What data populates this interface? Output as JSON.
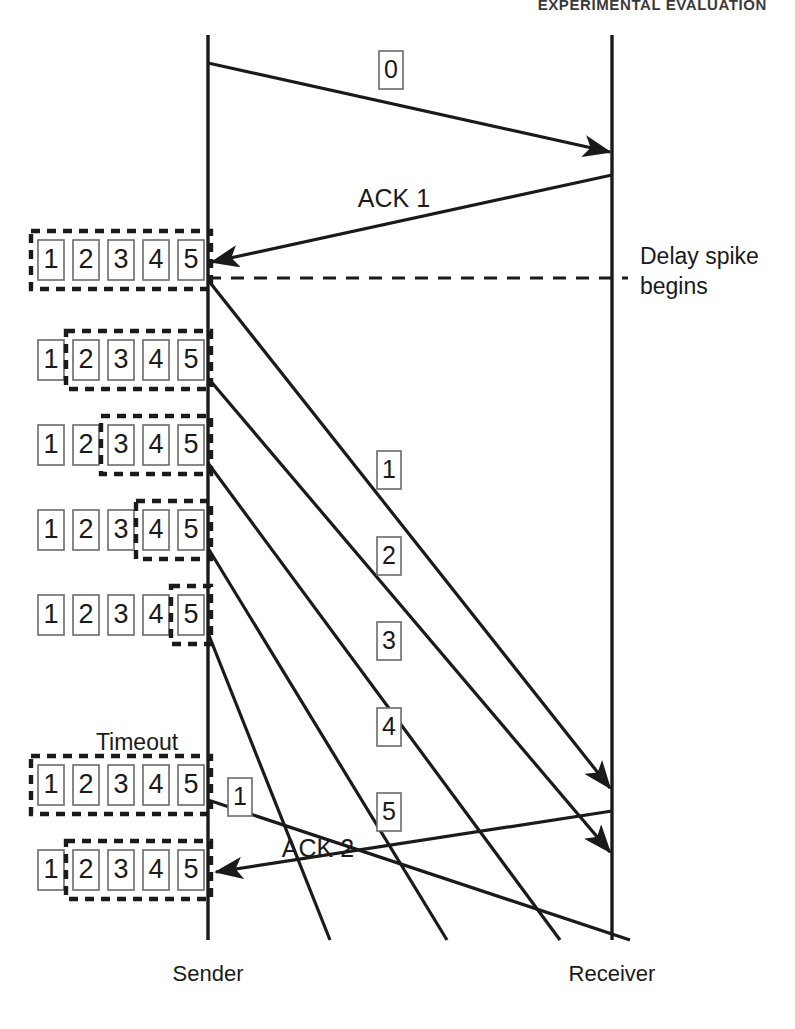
{
  "page": {
    "running_head": "EXPERIMENTAL EVALUATION",
    "width": 795,
    "height": 1029,
    "background": "#ffffff",
    "ink_color": "#1a1a1a"
  },
  "diagram": {
    "type": "sequence-timeline",
    "title_visible": false,
    "endpoints": {
      "sender": {
        "label": "Sender",
        "x": 208,
        "label_x": 208,
        "label_y": 975
      },
      "receiver": {
        "label": "Receiver",
        "x": 612,
        "label_x": 612,
        "label_y": 975
      }
    },
    "lifelines": [
      {
        "name": "sender-lifeline",
        "x": 208,
        "y1": 35,
        "y2": 940
      },
      {
        "name": "receiver-lifeline",
        "x": 612,
        "y1": 35,
        "y2": 940
      }
    ],
    "annotations": [
      {
        "name": "delay-spike-annotation",
        "line1": "Delay spike",
        "line2": "begins",
        "x": 640,
        "y1": 258,
        "y2": 288,
        "marker": "dashed-horizontal-line",
        "marker_y": 278,
        "marker_x1": 208,
        "marker_x2": 628
      },
      {
        "name": "timeout-annotation",
        "text": "Timeout",
        "x": 137,
        "y": 744
      }
    ],
    "messages": [
      {
        "name": "data-packet-0",
        "label": "0",
        "kind": "data",
        "boxed_label": true,
        "direction": "sender-to-receiver",
        "x1": 208,
        "y1": 63,
        "x2": 610,
        "y2": 152,
        "label_x": 391,
        "label_y": 70
      },
      {
        "name": "ack-1",
        "label": "ACK 1",
        "kind": "ack",
        "boxed_label": false,
        "direction": "receiver-to-sender",
        "x1": 612,
        "y1": 175,
        "x2": 212,
        "y2": 262,
        "label_x": 394,
        "label_y": 200
      },
      {
        "name": "data-packet-1",
        "label": "1",
        "kind": "data",
        "boxed_label": true,
        "direction": "sender-to-receiver",
        "x1": 208,
        "y1": 280,
        "x2": 610,
        "y2": 788,
        "label_x": 389,
        "label_y": 470
      },
      {
        "name": "data-packet-2",
        "label": "2",
        "kind": "data",
        "boxed_label": true,
        "direction": "sender-to-receiver",
        "x1": 208,
        "y1": 378,
        "x2": 610,
        "y2": 852,
        "label_x": 389,
        "label_y": 556
      },
      {
        "name": "data-packet-3",
        "label": "3",
        "kind": "data",
        "boxed_label": true,
        "direction": "sender-to-receiver",
        "x1": 208,
        "y1": 463,
        "x2": 560,
        "y2": 940,
        "label_x": 389,
        "label_y": 641
      },
      {
        "name": "data-packet-4",
        "label": "4",
        "kind": "data",
        "boxed_label": true,
        "direction": "sender-to-receiver",
        "x1": 208,
        "y1": 548,
        "x2": 447,
        "y2": 940,
        "label_x": 389,
        "label_y": 727
      },
      {
        "name": "data-packet-5",
        "label": "5",
        "kind": "data",
        "boxed_label": true,
        "direction": "sender-to-receiver",
        "x1": 208,
        "y1": 633,
        "x2": 330,
        "y2": 940,
        "label_x": 389,
        "label_y": 812
      },
      {
        "name": "data-packet-1-retransmit",
        "label": "1",
        "kind": "data-retransmit",
        "boxed_label": true,
        "direction": "sender-to-receiver",
        "x1": 208,
        "y1": 800,
        "x2": 630,
        "y2": 940,
        "label_x": 240,
        "label_y": 797
      },
      {
        "name": "ack-2",
        "label": "ACK 2",
        "kind": "ack",
        "boxed_label": false,
        "direction": "receiver-to-sender",
        "x1": 612,
        "y1": 811,
        "x2": 216,
        "y2": 872,
        "label_x": 318,
        "label_y": 850
      }
    ],
    "window_rows": [
      {
        "name": "window-row-1",
        "y": 240,
        "slots": [
          "1",
          "2",
          "3",
          "4",
          "5"
        ],
        "window_start_slot": 1,
        "window_end_slot": 5,
        "caption": "full window 1-5"
      },
      {
        "name": "window-row-2",
        "y": 340,
        "slots": [
          "1",
          "2",
          "3",
          "4",
          "5"
        ],
        "window_start_slot": 2,
        "window_end_slot": 5,
        "caption": "window 2-5"
      },
      {
        "name": "window-row-3",
        "y": 425,
        "slots": [
          "1",
          "2",
          "3",
          "4",
          "5"
        ],
        "window_start_slot": 3,
        "window_end_slot": 5,
        "caption": "window 3-5"
      },
      {
        "name": "window-row-4",
        "y": 510,
        "slots": [
          "1",
          "2",
          "3",
          "4",
          "5"
        ],
        "window_start_slot": 4,
        "window_end_slot": 5,
        "caption": "window 4-5"
      },
      {
        "name": "window-row-5",
        "y": 595,
        "slots": [
          "1",
          "2",
          "3",
          "4",
          "5"
        ],
        "window_start_slot": 5,
        "window_end_slot": 5,
        "caption": "window 5"
      },
      {
        "name": "window-row-6",
        "y": 765,
        "slots": [
          "1",
          "2",
          "3",
          "4",
          "5"
        ],
        "window_start_slot": 1,
        "window_end_slot": 5,
        "caption": "window reset 1-5 after timeout"
      },
      {
        "name": "window-row-7",
        "y": 850,
        "slots": [
          "1",
          "2",
          "3",
          "4",
          "5"
        ],
        "window_start_slot": 2,
        "window_end_slot": 5,
        "caption": "window 2-5 after ACK 2"
      }
    ],
    "window_geometry": {
      "slot_width": 26,
      "slot_height": 40,
      "slot_gap": 9,
      "row_left": 38,
      "window_pad_x": 7,
      "window_pad_y": 9
    }
  }
}
